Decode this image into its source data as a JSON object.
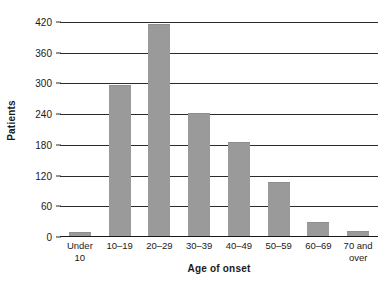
{
  "chart_data": {
    "type": "bar",
    "title": "",
    "xlabel": "Age of onset",
    "ylabel": "Patients",
    "categories": [
      "Under 10",
      "10–19",
      "20–29",
      "30–39",
      "40–49",
      "50–59",
      "60–69",
      "70 and over"
    ],
    "category_lines": [
      [
        "Under",
        "10"
      ],
      [
        "10–19"
      ],
      [
        "20–29"
      ],
      [
        "30–39"
      ],
      [
        "40–49"
      ],
      [
        "50–59"
      ],
      [
        "60–69"
      ],
      [
        "70 and",
        "over"
      ]
    ],
    "values": [
      8,
      295,
      415,
      240,
      183,
      105,
      28,
      10
    ],
    "ylim": [
      0,
      420
    ],
    "yticks": [
      0,
      60,
      120,
      180,
      240,
      300,
      360,
      420
    ],
    "ytick_labels": [
      "0",
      "60",
      "120",
      "180",
      "240",
      "300",
      "360",
      "420"
    ],
    "grid": "horizontal",
    "legend": "none",
    "bar_color": "#9a9a9a",
    "axis_color": "#2b2b2b",
    "text_color": "#1a1a1a"
  }
}
